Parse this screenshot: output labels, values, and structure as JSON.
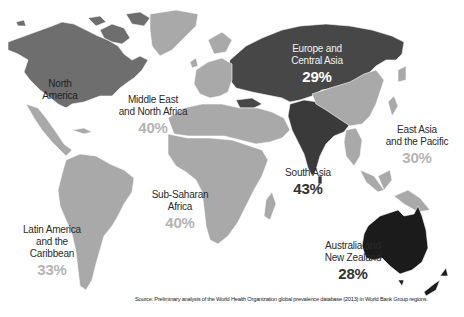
{
  "map": {
    "title": "",
    "colors": {
      "north_america": "#6e6e6e",
      "europe_central_asia": "#474747",
      "south_asia": "#3a3a3a",
      "australia_nz": "#1b1b1b",
      "light_regions": "#a9a9a9",
      "background": "#ffffff"
    },
    "regions": [
      {
        "id": "north-america",
        "name": "North America",
        "value": "21%"
      },
      {
        "id": "middle-east-north-africa",
        "name": "Middle East and North Africa",
        "line1": "Middle East",
        "line2": "and North Africa",
        "value": "40%"
      },
      {
        "id": "europe-central-asia",
        "name": "Europe and Central Asia",
        "line1": "Europe and",
        "line2": "Central Asia",
        "value": "29%"
      },
      {
        "id": "east-asia-pacific",
        "name": "East Asia and the Pacific",
        "line1": "East Asia",
        "line2": "and the Pacific",
        "value": "30%"
      },
      {
        "id": "south-asia",
        "name": "South Asia",
        "value": "43%"
      },
      {
        "id": "sub-saharan-africa",
        "name": "Sub-Saharan Africa",
        "line1": "Sub-Saharan",
        "line2": "Africa",
        "value": "40%"
      },
      {
        "id": "latin-america-caribbean",
        "name": "Latin America and the Caribbean",
        "line1": "Latin America",
        "line2": "and the Caribbean",
        "value": "33%"
      },
      {
        "id": "australia-new-zealand",
        "name": "Australia and New Zealand",
        "line1": "Australia and",
        "line2": "New Zealand",
        "value": "28%"
      }
    ],
    "source": "Source: Preliminary analysis of the World Health Organization global prevalence database (2013) in World Bank Group regions."
  }
}
